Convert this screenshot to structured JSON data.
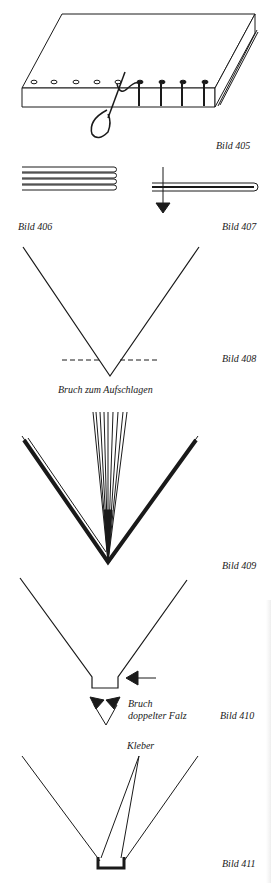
{
  "figures": [
    {
      "id": "405",
      "caption": "Bild 405",
      "subject": "book block with sewing stations and needle/thread"
    },
    {
      "id": "406",
      "caption": "Bild 406",
      "subject": "stacked folded sheets"
    },
    {
      "id": "407",
      "caption": "Bild 407",
      "subject": "folded sheet with downward arrow"
    },
    {
      "id": "408",
      "caption": "Bild 408",
      "label": "Bruch zum Aufschlagen",
      "subject": "V fold with dashed line"
    },
    {
      "id": "409",
      "caption": "Bild 409",
      "subject": "opened signatures fanning from fold"
    },
    {
      "id": "410",
      "caption": "Bild 410",
      "labels": [
        "Bruch",
        "doppelter Falz"
      ],
      "subject": "V fold with flat bottom and arrows"
    },
    {
      "id": "411",
      "caption": "Bild 411",
      "label": "Kleber",
      "subject": "V fold with glued channel"
    }
  ],
  "colors": {
    "ink": "#1a1a1a",
    "paper": "#ffffff"
  }
}
